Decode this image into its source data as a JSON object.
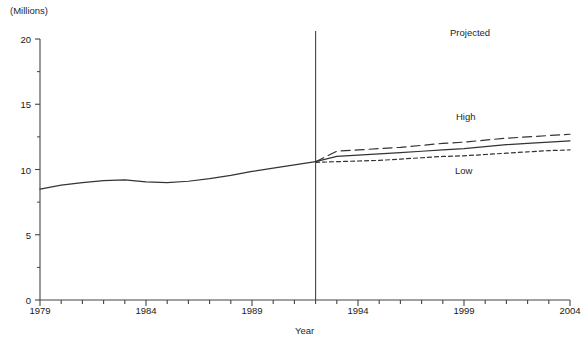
{
  "chart_data": {
    "type": "line",
    "title": "",
    "unit_label": "(Millions)",
    "xlabel": "Year",
    "ylabel": "",
    "xlim": [
      1979,
      2004
    ],
    "ylim": [
      0,
      20
    ],
    "grid": false,
    "legend_position": "inline-annotations",
    "y_ticks": [
      0,
      5,
      10,
      15,
      20
    ],
    "y_tick_labels": [
      "0",
      "5",
      "10",
      "15",
      "20"
    ],
    "y_minor_ticks": [
      2.5,
      7.5,
      12.5,
      17.5
    ],
    "x_ticks": [
      1979,
      1980,
      1981,
      1982,
      1983,
      1984,
      1985,
      1986,
      1987,
      1988,
      1989,
      1990,
      1991,
      1992,
      1993,
      1994,
      1995,
      1996,
      1997,
      1998,
      1999,
      2000,
      2001,
      2002,
      2003,
      2004
    ],
    "x_tick_labels": [
      "1979",
      "1984",
      "1989",
      "1994",
      "1999",
      "2004"
    ],
    "x_labeled_ticks": [
      1979,
      1984,
      1989,
      1994,
      1999,
      2004
    ],
    "projection_divider_year": 1992,
    "annotations": [
      {
        "text": "Projected",
        "x": 1999.2,
        "y": 18.4
      },
      {
        "text": "High",
        "x": 1999.5,
        "y": 12.9
      },
      {
        "text": "Low",
        "x": 1999.4,
        "y": 9.0
      }
    ],
    "series": [
      {
        "name": "Actual",
        "style": "solid",
        "x": [
          1979,
          1980,
          1981,
          1982,
          1983,
          1984,
          1985,
          1986,
          1987,
          1988,
          1989,
          1990,
          1991,
          1992
        ],
        "values": [
          8.5,
          8.8,
          9.0,
          9.15,
          9.2,
          9.05,
          9.0,
          9.1,
          9.3,
          9.55,
          9.85,
          10.1,
          10.35,
          10.6
        ]
      },
      {
        "name": "High",
        "style": "long-dash",
        "x": [
          1992,
          1993,
          1994,
          1995,
          1996,
          1997,
          1998,
          1999,
          2000,
          2001,
          2002,
          2003,
          2004
        ],
        "values": [
          10.6,
          11.4,
          11.5,
          11.6,
          11.7,
          11.85,
          12.0,
          12.1,
          12.25,
          12.4,
          12.5,
          12.6,
          12.7
        ]
      },
      {
        "name": "Middle",
        "style": "solid",
        "x": [
          1992,
          1993,
          1994,
          1995,
          1996,
          1997,
          1998,
          1999,
          2000,
          2001,
          2002,
          2003,
          2004
        ],
        "values": [
          10.6,
          11.0,
          11.1,
          11.2,
          11.3,
          11.4,
          11.5,
          11.6,
          11.75,
          11.9,
          12.0,
          12.1,
          12.2
        ]
      },
      {
        "name": "Low",
        "style": "short-dash",
        "x": [
          1992,
          1993,
          1994,
          1995,
          1996,
          1997,
          1998,
          1999,
          2000,
          2001,
          2002,
          2003,
          2004
        ],
        "values": [
          10.55,
          10.6,
          10.65,
          10.7,
          10.8,
          10.9,
          11.0,
          11.05,
          11.15,
          11.25,
          11.35,
          11.45,
          11.5
        ]
      }
    ],
    "colors": {
      "axis": "#444444",
      "line": "#333333",
      "text": "#1f1f1f",
      "background": "#ffffff"
    }
  }
}
